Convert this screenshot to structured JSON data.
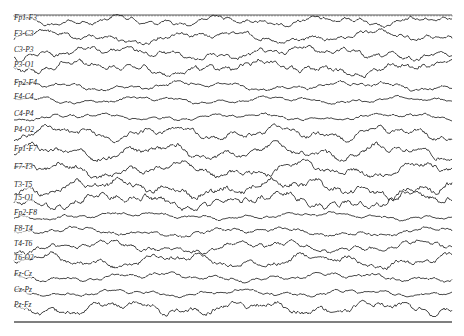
{
  "chart_data": {
    "type": "line",
    "title": "",
    "xlabel": "",
    "ylabel": "",
    "grid": false,
    "top_border": "dotted time-tick line",
    "bottom_border": "solid line",
    "channels": [
      {
        "label": "Fp1-F3",
        "y": 21,
        "amp": 6
      },
      {
        "label": "F3-C3",
        "y": 37,
        "amp": 7
      },
      {
        "label": "C3-P3",
        "y": 53,
        "amp": 7
      },
      {
        "label": "P3-O1",
        "y": 68,
        "amp": 8
      },
      {
        "label": "Fp2-F4",
        "y": 86,
        "amp": 5
      },
      {
        "label": "F4-C4",
        "y": 100,
        "amp": 4
      },
      {
        "label": "C4-P4",
        "y": 117,
        "amp": 4
      },
      {
        "label": "P4-O2",
        "y": 133,
        "amp": 8
      },
      {
        "label": "Fp1-F7",
        "y": 152,
        "amp": 9
      },
      {
        "label": "F7-T3",
        "y": 170,
        "amp": 9
      },
      {
        "label": "T3-T5",
        "y": 188,
        "amp": 10
      },
      {
        "label": "T5-O1",
        "y": 201,
        "amp": 9
      },
      {
        "label": "Fp2-F8",
        "y": 216,
        "amp": 4
      },
      {
        "label": "F8-T4",
        "y": 232,
        "amp": 5
      },
      {
        "label": "T4-T6",
        "y": 247,
        "amp": 7
      },
      {
        "label": "T6-O2",
        "y": 261,
        "amp": 8
      },
      {
        "label": "Fz-Cz",
        "y": 277,
        "amp": 5
      },
      {
        "label": "Cz-Pz",
        "y": 293,
        "amp": 4
      },
      {
        "label": "Pz-Fz",
        "y": 308,
        "amp": 8
      }
    ],
    "plot_area": {
      "x0": 14,
      "x1": 452,
      "y_top": 15,
      "y_bottom": 322
    }
  },
  "colors": {
    "trace": "#1a1a1a",
    "border": "#555555",
    "background": "#ffffff"
  }
}
